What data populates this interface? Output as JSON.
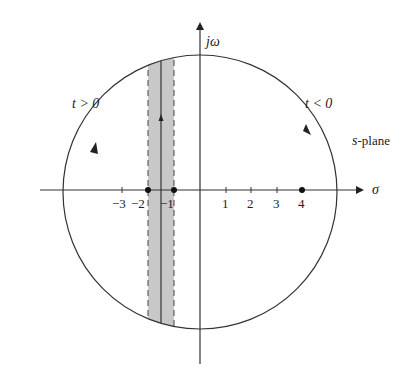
{
  "diagram": {
    "title": "s-plane",
    "plane_label": {
      "italic": "s",
      "rest": "-plane"
    },
    "axes": {
      "horizontal_label": "σ",
      "vertical_label": "jω"
    },
    "tick_labels": [
      "−3",
      "−2",
      "−1",
      "1",
      "2",
      "3",
      "4"
    ],
    "tick_values": [
      -3,
      -2,
      -1,
      1,
      2,
      3,
      4
    ],
    "contour_labels": {
      "left": "t > 0",
      "right": "t < 0"
    },
    "marked_points": [
      -1.75,
      -0.75,
      4
    ],
    "strip": {
      "left_boundary": -1.75,
      "right_boundary": -0.75,
      "center_line": -1.25,
      "fill_color": "#c8c8c8",
      "boundary_style": "dashed"
    },
    "colors": {
      "stroke": "#333333",
      "shade": "#c8c8c8"
    }
  }
}
